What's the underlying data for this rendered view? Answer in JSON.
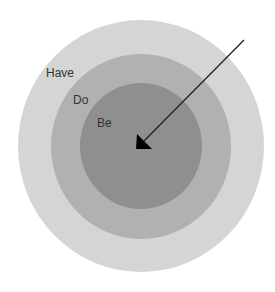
{
  "diagram": {
    "type": "concentric-circles",
    "rings": [
      {
        "label": "Have",
        "color": "#d5d5d5"
      },
      {
        "label": "Do",
        "color": "#b1b1b1"
      },
      {
        "label": "Be",
        "color": "#8f8f8f"
      }
    ],
    "arrow": {
      "color": "#111111",
      "direction": "toward-center"
    }
  }
}
